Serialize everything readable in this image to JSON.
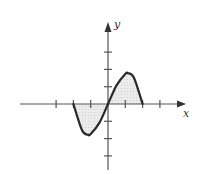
{
  "chart_data": {
    "type": "line",
    "title": "",
    "xlabel": "x",
    "ylabel": "y",
    "function_description": "cubic curve crossing the x-axis at -2, 0 and 2; region between curve and x-axis shaded",
    "x_ticks": [
      -3,
      -2,
      -1,
      1,
      2,
      3
    ],
    "y_ticks": [
      -3,
      -2,
      -1,
      1,
      2,
      3
    ],
    "tick_labels_shown": false,
    "xlim": [
      -5,
      4.4
    ],
    "ylim": [
      -3.8,
      4.6
    ],
    "grid": false,
    "legend": null,
    "series": [
      {
        "name": "curve",
        "x": [
          -2,
          -1.5,
          -1.15,
          -1,
          -0.5,
          0,
          0.5,
          1,
          1.15,
          1.5,
          2
        ],
        "y": [
          0,
          -1.52,
          -1.78,
          -1.74,
          -1.09,
          0,
          1.09,
          1.74,
          1.78,
          1.52,
          0
        ]
      }
    ],
    "shaded_regions": [
      {
        "from_x": -2,
        "to_x": 0,
        "side": "below-axis"
      },
      {
        "from_x": 0,
        "to_x": 2,
        "side": "above-axis"
      }
    ],
    "colors": {
      "curve": "#2a2a2a",
      "axis": "#555555",
      "fill": "#e6e6e6"
    }
  },
  "labels": {
    "x_axis": "x",
    "y_axis": "y"
  }
}
